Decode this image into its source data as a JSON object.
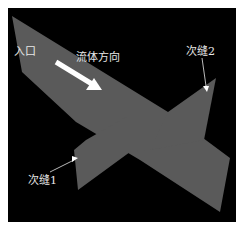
{
  "diagram": {
    "labels": {
      "inlet": "入口",
      "flow_direction": "流体方向",
      "secondary_fracture_1": "次缝1",
      "secondary_fracture_2": "次缝2"
    },
    "colors": {
      "background": "#000000",
      "fracture_plane": "#5a5a5a",
      "arrow": "#ffffff",
      "label": "#e8e8e8"
    }
  }
}
